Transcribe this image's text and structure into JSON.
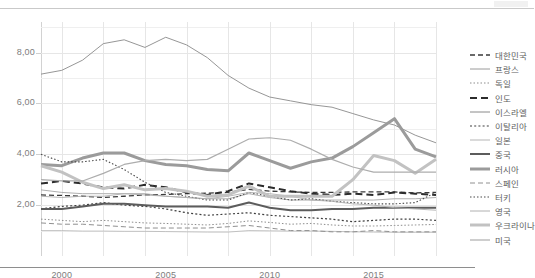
{
  "chart_data": {
    "type": "line",
    "title": "",
    "subtitle": "",
    "xlabel": "",
    "ylabel": "",
    "xlim": [
      1999,
      2018
    ],
    "ylim": [
      0.0,
      9.2
    ],
    "yticks": [
      "2,00",
      "4,00",
      "6,00",
      "8,00"
    ],
    "ytick_values": [
      2.0,
      4.0,
      6.0,
      8.0
    ],
    "xticks": [
      "2000",
      "2005",
      "2010",
      "2015"
    ],
    "xtick_values": [
      2000,
      2005,
      2010,
      2015
    ],
    "grid": true,
    "legend_position": "right",
    "decimal_separator": ",",
    "x": [
      1999,
      2000,
      2001,
      2002,
      2003,
      2004,
      2005,
      2006,
      2007,
      2008,
      2009,
      2010,
      2011,
      2012,
      2013,
      2014,
      2015,
      2016,
      2017,
      2018
    ],
    "series": [
      {
        "name": "대한민국",
        "style": "dashed",
        "width": 1.3,
        "color": "#3a3a3a",
        "values": [
          2.4,
          2.38,
          2.35,
          2.3,
          2.35,
          2.4,
          2.42,
          2.45,
          2.47,
          2.5,
          2.62,
          2.55,
          2.52,
          2.5,
          2.5,
          2.52,
          2.52,
          2.52,
          2.48,
          2.5
        ]
      },
      {
        "name": "프랑스",
        "style": "solid",
        "width": 0.8,
        "color": "#9a9a9a",
        "values": [
          2.6,
          2.5,
          2.45,
          2.45,
          2.45,
          2.45,
          2.35,
          2.3,
          2.25,
          2.25,
          2.45,
          2.3,
          2.2,
          2.2,
          2.2,
          2.2,
          2.2,
          2.25,
          2.25,
          2.3
        ]
      },
      {
        "name": "독일",
        "style": "dotted",
        "width": 1.0,
        "color": "#8d8d8d",
        "values": [
          1.45,
          1.4,
          1.35,
          1.4,
          1.35,
          1.3,
          1.28,
          1.25,
          1.22,
          1.28,
          1.38,
          1.32,
          1.25,
          1.28,
          1.22,
          1.18,
          1.18,
          1.2,
          1.22,
          1.24
        ]
      },
      {
        "name": "인도",
        "style": "dashed",
        "width": 2.0,
        "color": "#2c2c2c",
        "values": [
          2.85,
          2.95,
          2.85,
          2.7,
          2.65,
          2.8,
          2.7,
          2.5,
          2.4,
          2.55,
          2.85,
          2.7,
          2.55,
          2.45,
          2.4,
          2.45,
          2.4,
          2.5,
          2.45,
          2.4
        ]
      },
      {
        "name": "이스라엘",
        "style": "solid",
        "width": 0.9,
        "color": "#8a8a8a",
        "values": [
          7.15,
          7.3,
          7.7,
          8.35,
          8.5,
          8.2,
          8.6,
          8.3,
          7.8,
          7.1,
          6.6,
          6.25,
          6.1,
          5.95,
          5.85,
          5.6,
          5.35,
          5.15,
          4.75,
          4.45
        ]
      },
      {
        "name": "이탈리아",
        "style": "dotted",
        "width": 1.2,
        "color": "#3f3f3f",
        "values": [
          1.85,
          1.95,
          2.0,
          2.1,
          2.0,
          1.95,
          1.85,
          1.7,
          1.6,
          1.65,
          1.7,
          1.6,
          1.55,
          1.5,
          1.45,
          1.35,
          1.4,
          1.45,
          1.45,
          1.4
        ]
      },
      {
        "name": "일본",
        "style": "solid",
        "width": 0.8,
        "color": "#b5b5b5",
        "values": [
          1.0,
          1.0,
          0.98,
          0.98,
          0.97,
          0.97,
          0.96,
          0.95,
          0.94,
          0.94,
          1.0,
          0.99,
          0.98,
          0.98,
          0.97,
          0.95,
          0.94,
          0.93,
          0.93,
          0.93
        ]
      },
      {
        "name": "중국",
        "style": "solid",
        "width": 2.0,
        "color": "#5c5c5c",
        "values": [
          1.85,
          1.85,
          1.95,
          2.05,
          2.05,
          2.0,
          1.95,
          1.95,
          1.95,
          1.9,
          2.1,
          1.9,
          1.8,
          1.8,
          1.85,
          1.85,
          1.9,
          1.9,
          1.9,
          1.9
        ]
      },
      {
        "name": "러시아",
        "style": "solid",
        "width": 3.0,
        "color": "#9b9b9b",
        "values": [
          3.6,
          3.55,
          3.85,
          4.05,
          4.05,
          3.75,
          3.6,
          3.55,
          3.4,
          3.35,
          4.05,
          3.75,
          3.45,
          3.7,
          3.85,
          4.3,
          4.85,
          5.4,
          4.2,
          3.9
        ]
      },
      {
        "name": "스페인",
        "style": "dashed",
        "width": 1.0,
        "color": "#909090",
        "values": [
          1.3,
          1.25,
          1.25,
          1.2,
          1.15,
          1.1,
          1.1,
          1.1,
          1.1,
          1.15,
          1.2,
          1.1,
          1.0,
          1.0,
          0.95,
          0.95,
          1.0,
          0.95,
          0.95,
          0.95
        ]
      },
      {
        "name": "터키",
        "style": "dotted",
        "width": 1.1,
        "color": "#4a4a4a",
        "values": [
          4.0,
          3.7,
          3.7,
          3.8,
          3.4,
          2.9,
          2.5,
          2.35,
          2.2,
          2.2,
          2.5,
          2.35,
          2.2,
          2.25,
          2.15,
          2.1,
          2.05,
          2.05,
          2.1,
          2.5
        ]
      },
      {
        "name": "영국",
        "style": "solid",
        "width": 0.9,
        "color": "#b0b0b0",
        "values": [
          2.35,
          2.3,
          2.35,
          2.35,
          2.45,
          2.4,
          2.35,
          2.3,
          2.25,
          2.35,
          2.5,
          2.45,
          2.35,
          2.2,
          2.15,
          2.05,
          2.0,
          1.9,
          1.85,
          1.8
        ]
      },
      {
        "name": "우크라이나",
        "style": "solid",
        "width": 3.0,
        "color": "#c2c2c2",
        "values": [
          3.55,
          3.3,
          2.9,
          2.65,
          2.8,
          2.6,
          2.65,
          2.55,
          2.35,
          2.4,
          2.75,
          2.35,
          2.35,
          2.35,
          2.35,
          3.0,
          3.95,
          3.75,
          3.25,
          3.8
        ]
      },
      {
        "name": "미국",
        "style": "solid",
        "width": 1.2,
        "color": "#adadad",
        "values": [
          3.0,
          2.95,
          2.95,
          3.25,
          3.6,
          3.75,
          3.8,
          3.75,
          3.8,
          4.2,
          4.6,
          4.65,
          4.55,
          4.2,
          3.8,
          3.5,
          3.3,
          3.3,
          3.3,
          3.3
        ]
      }
    ]
  },
  "legend": {
    "items": [
      {
        "label": "대한민국"
      },
      {
        "label": "프랑스"
      },
      {
        "label": "독일"
      },
      {
        "label": "인도"
      },
      {
        "label": "이스라엘"
      },
      {
        "label": "이탈리아"
      },
      {
        "label": "일본"
      },
      {
        "label": "중국"
      },
      {
        "label": "러시아"
      },
      {
        "label": "스페인"
      },
      {
        "label": "터키"
      },
      {
        "label": "영국"
      },
      {
        "label": "우크라이나"
      },
      {
        "label": "미국"
      }
    ]
  }
}
